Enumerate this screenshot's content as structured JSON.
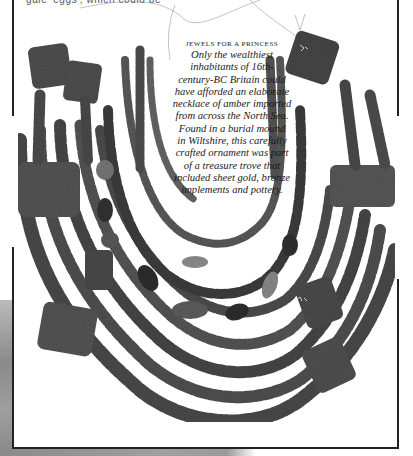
{
  "page": {
    "top_text_left": "gale 'eggs', which could be",
    "top_text_right": "a ... ... ... ...",
    "colors": {
      "ink": "#1a1a1a",
      "bead_dark": "#3a3a3a",
      "bead_mid": "#5c5c5c",
      "bead_light": "#8e8e8e",
      "frame": "#222222",
      "paper": "#ffffff"
    }
  },
  "figure": {
    "caption": {
      "heading": "JEWELS FOR A PRINCESS",
      "lines": [
        "Only the wealthiest",
        "inhabitants of 16th-",
        "century-BC Britain could",
        "have afforded an elaborate",
        "necklace of amber imported",
        "from across the North Sea.",
        "Found in a burial mound",
        "in Wiltshire, this carefully",
        "crafted ornament was part",
        "of a treasure trove that",
        "included sheet gold, bronze",
        "implements and pottery."
      ]
    }
  }
}
